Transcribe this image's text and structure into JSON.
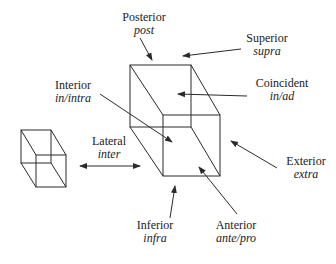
{
  "diagram": {
    "type": "spatial-relations",
    "labels": [
      {
        "id": "posterior",
        "term": "Posterior",
        "latin": "post"
      },
      {
        "id": "superior",
        "term": "Superior",
        "latin": "supra"
      },
      {
        "id": "interior",
        "term": "Interior",
        "latin": "in/intra"
      },
      {
        "id": "coincident",
        "term": "Coincident",
        "latin": "in/ad"
      },
      {
        "id": "lateral",
        "term": "Lateral",
        "latin": "inter"
      },
      {
        "id": "exterior",
        "term": "Exterior",
        "latin": "extra"
      },
      {
        "id": "inferior",
        "term": "Inferior",
        "latin": "infra"
      },
      {
        "id": "anterior",
        "term": "Anterior",
        "latin": "ante/pro"
      }
    ],
    "colors": {
      "line": "#2a2a2a",
      "background": "#ffffff"
    }
  }
}
